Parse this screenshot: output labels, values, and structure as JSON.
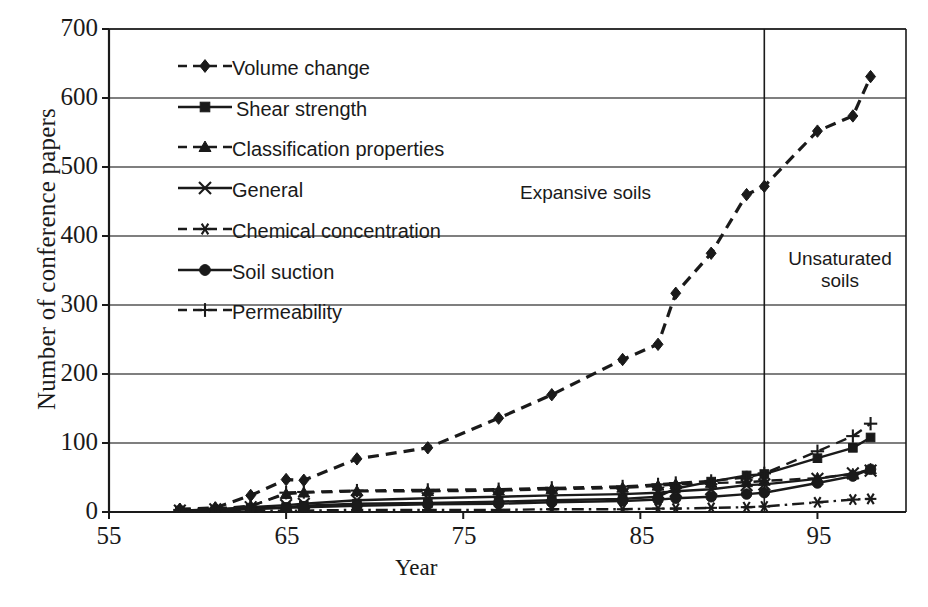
{
  "chart_data": {
    "type": "line",
    "title": "",
    "xlabel": "Year",
    "ylabel": "Number of conference papers",
    "xlim": [
      55,
      100
    ],
    "ylim": [
      0,
      700
    ],
    "xticks": [
      55,
      65,
      75,
      85,
      95
    ],
    "yticks": [
      0,
      100,
      200,
      300,
      400,
      500,
      600,
      700
    ],
    "grid": "horizontal",
    "legend_position": "upper-left-inside",
    "annotations": [
      {
        "text": "Expansive soils",
        "x": 81,
        "y": 430
      },
      {
        "text": "Unsaturated soils",
        "x": 96,
        "y": 330
      },
      {
        "text": "divider",
        "type": "vline",
        "x": 92
      }
    ],
    "x": [
      59,
      61,
      63,
      65,
      66,
      69,
      73,
      77,
      80,
      84,
      86,
      87,
      89,
      91,
      92,
      95,
      97,
      98
    ],
    "series": [
      {
        "name": "Volume change",
        "marker": "diamond",
        "line": "dashed",
        "values": [
          4,
          6,
          24,
          47,
          46,
          77,
          93,
          136,
          170,
          221,
          243,
          317,
          375,
          460,
          472,
          552,
          574,
          631
        ]
      },
      {
        "name": "Shear strength",
        "marker": "square",
        "line": "solid",
        "values": [
          2,
          3,
          5,
          7,
          9,
          12,
          13,
          15,
          17,
          19,
          22,
          34,
          44,
          53,
          55,
          78,
          93,
          108
        ]
      },
      {
        "name": "Classification properties",
        "marker": "triangle",
        "line": "dashed",
        "values": [
          3,
          5,
          9,
          26,
          28,
          30,
          30,
          31,
          33,
          35,
          38,
          40,
          42,
          43,
          45,
          49,
          55,
          62
        ]
      },
      {
        "name": "General",
        "marker": "cross-x",
        "line": "solid",
        "values": [
          2,
          4,
          7,
          10,
          12,
          17,
          20,
          22,
          24,
          26,
          28,
          30,
          33,
          39,
          40,
          48,
          56,
          60
        ]
      },
      {
        "name": "Chemical concentration",
        "marker": "asterisk",
        "line": "dash-dot",
        "values": [
          1,
          1,
          2,
          2,
          2,
          3,
          3,
          3,
          4,
          4,
          5,
          5,
          6,
          7,
          8,
          14,
          18,
          19
        ]
      },
      {
        "name": "Soil suction",
        "marker": "circle",
        "line": "solid",
        "values": [
          1,
          2,
          4,
          6,
          7,
          9,
          11,
          12,
          14,
          16,
          18,
          20,
          22,
          26,
          28,
          42,
          52,
          62
        ]
      },
      {
        "name": "Permeability",
        "marker": "plus",
        "line": "dashed",
        "values": [
          3,
          5,
          8,
          28,
          29,
          31,
          32,
          33,
          35,
          37,
          40,
          42,
          45,
          50,
          56,
          88,
          110,
          128
        ]
      }
    ]
  },
  "axes": {
    "y_title": "Number of conference papers",
    "x_title": "Year",
    "y_tick_labels": [
      "700",
      "600",
      "500",
      "400",
      "300",
      "200",
      "100",
      "0"
    ],
    "x_tick_labels": [
      "55",
      "65",
      "75",
      "85",
      "95"
    ]
  },
  "regions": {
    "expansive": "Expansive soils",
    "unsaturated_line1": "Unsaturated",
    "unsaturated_line2": "soils"
  },
  "legend": {
    "items": [
      {
        "label": "Volume change",
        "marker": "diamond-marker-icon"
      },
      {
        "label": "Shear strength",
        "marker": "square-marker-icon"
      },
      {
        "label": "Classification properties",
        "marker": "triangle-marker-icon"
      },
      {
        "label": "General",
        "marker": "x-marker-icon"
      },
      {
        "label": "Chemical concentration",
        "marker": "asterisk-marker-icon"
      },
      {
        "label": "Soil suction",
        "marker": "circle-marker-icon"
      },
      {
        "label": "Permeability",
        "marker": "plus-marker-icon"
      }
    ]
  },
  "style": {
    "ink": "#1a1a1a",
    "grid": "#555555",
    "background": "#ffffff"
  }
}
